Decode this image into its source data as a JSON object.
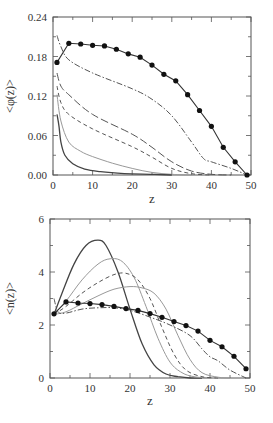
{
  "chart_data": [
    {
      "type": "line",
      "title": "",
      "xlabel": "z",
      "ylabel": "<φ(z)>",
      "xlim": [
        0,
        50
      ],
      "ylim": [
        0,
        0.24
      ],
      "xticks": [
        "0",
        "10",
        "20",
        "30",
        "40",
        "50"
      ],
      "yticks": [
        "0.00",
        "0.06",
        "0.12",
        "0.18",
        "0.24"
      ],
      "grid": false,
      "legend": null,
      "series": [
        {
          "name": "dots",
          "style": "solid+markers",
          "x": [
            1,
            4,
            7,
            10,
            13,
            16,
            19,
            22,
            25,
            28,
            31,
            34,
            37,
            40,
            43,
            46,
            49
          ],
          "y": [
            0.171,
            0.2,
            0.199,
            0.197,
            0.196,
            0.191,
            0.184,
            0.179,
            0.167,
            0.153,
            0.143,
            0.122,
            0.098,
            0.074,
            0.042,
            0.02,
            0.0
          ]
        },
        {
          "name": "dash-dot",
          "style": "dashdot",
          "x": [
            1,
            2,
            4,
            10,
            20,
            25,
            30,
            35,
            38,
            40,
            45,
            49
          ],
          "y": [
            0.212,
            0.195,
            0.175,
            0.155,
            0.131,
            0.115,
            0.09,
            0.05,
            0.025,
            0.02,
            0.01,
            0.0
          ]
        },
        {
          "name": "long-dash",
          "style": "longdash",
          "x": [
            1,
            2,
            4,
            10,
            20,
            25,
            30,
            35,
            40,
            45
          ],
          "y": [
            0.155,
            0.135,
            0.122,
            0.092,
            0.062,
            0.042,
            0.02,
            0.006,
            0.001,
            0.0
          ]
        },
        {
          "name": "short-dash",
          "style": "dashed",
          "x": [
            1,
            2,
            4,
            10,
            20,
            25,
            30,
            35,
            40
          ],
          "y": [
            0.135,
            0.11,
            0.092,
            0.07,
            0.043,
            0.027,
            0.01,
            0.002,
            0.0
          ]
        },
        {
          "name": "thin-solid",
          "style": "solid-gray",
          "x": [
            1,
            2,
            4,
            7,
            10,
            15,
            20,
            25,
            30,
            35
          ],
          "y": [
            0.122,
            0.082,
            0.05,
            0.036,
            0.028,
            0.018,
            0.01,
            0.004,
            0.001,
            0.0
          ]
        },
        {
          "name": "thick-solid",
          "style": "solid",
          "x": [
            1,
            1.5,
            2,
            3,
            5,
            8,
            12,
            18,
            25,
            30
          ],
          "y": [
            0.092,
            0.075,
            0.05,
            0.03,
            0.017,
            0.009,
            0.005,
            0.002,
            0.001,
            0.0
          ]
        }
      ]
    },
    {
      "type": "line",
      "title": "",
      "xlabel": "z",
      "ylabel": "<n(z)>",
      "xlim": [
        0,
        50
      ],
      "ylim": [
        0,
        6
      ],
      "xticks": [
        "0",
        "10",
        "20",
        "30",
        "40",
        "50"
      ],
      "yticks": [
        "0",
        "2",
        "4",
        "6"
      ],
      "grid": false,
      "legend": null,
      "series": [
        {
          "name": "thick-solid",
          "style": "solid",
          "x": [
            1,
            3,
            6,
            9,
            12,
            14,
            17,
            20,
            23,
            26,
            29,
            32,
            35,
            38
          ],
          "y": [
            2.4,
            3.2,
            4.3,
            5.0,
            5.2,
            5.0,
            4.0,
            2.6,
            1.3,
            0.5,
            0.15,
            0.05,
            0.0,
            0.0
          ]
        },
        {
          "name": "thin-solid-1",
          "style": "solid-gray",
          "x": [
            1,
            4,
            8,
            12,
            15,
            18,
            21,
            24,
            27,
            30,
            33,
            36,
            40
          ],
          "y": [
            2.4,
            2.9,
            3.7,
            4.3,
            4.5,
            4.4,
            3.8,
            2.7,
            1.5,
            0.6,
            0.2,
            0.05,
            0.0
          ]
        },
        {
          "name": "short-dash",
          "style": "dashed",
          "x": [
            1,
            4,
            8,
            12,
            16,
            19,
            22,
            25,
            28,
            31,
            34,
            38,
            42
          ],
          "y": [
            2.4,
            2.7,
            3.2,
            3.6,
            3.9,
            3.95,
            3.7,
            3.0,
            1.9,
            0.9,
            0.3,
            0.05,
            0.0
          ]
        },
        {
          "name": "thin-solid-2",
          "style": "solid-gray",
          "x": [
            1,
            4,
            8,
            12,
            16,
            20,
            23,
            26,
            29,
            32,
            35,
            38,
            42,
            45
          ],
          "y": [
            2.4,
            2.5,
            2.8,
            3.1,
            3.35,
            3.45,
            3.4,
            3.2,
            2.6,
            1.6,
            0.7,
            0.2,
            0.03,
            0.0
          ]
        },
        {
          "name": "dash-dot",
          "style": "dashdot",
          "x": [
            1,
            2,
            4,
            8,
            12,
            16,
            20,
            25,
            30,
            35,
            38,
            40,
            42,
            45,
            49
          ],
          "y": [
            3.0,
            2.5,
            2.45,
            2.6,
            2.65,
            2.65,
            2.55,
            2.3,
            2.0,
            1.6,
            1.1,
            0.8,
            0.65,
            0.3,
            0.0
          ]
        },
        {
          "name": "dots",
          "style": "solid+markers",
          "x": [
            1,
            4,
            7,
            10,
            13,
            16,
            19,
            22,
            25,
            28,
            31,
            34,
            37,
            40,
            43,
            46,
            49
          ],
          "y": [
            2.42,
            2.87,
            2.83,
            2.81,
            2.77,
            2.7,
            2.62,
            2.55,
            2.43,
            2.29,
            2.13,
            1.98,
            1.77,
            1.42,
            1.18,
            0.82,
            0.35
          ]
        }
      ]
    }
  ]
}
